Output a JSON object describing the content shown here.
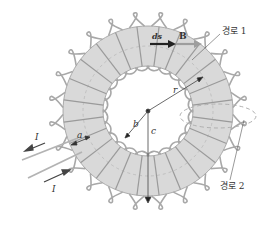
{
  "figure": {
    "type": "toroid",
    "turns": 24,
    "colors": {
      "core_fill": "#d9d9d9",
      "core_stroke": "#9a9a9a",
      "winding": "#a8a8a8",
      "path_dashed": "#b0b0b0",
      "arrow_dark": "#333333",
      "arrow_light": "#9e9e9e",
      "text": "#333333"
    }
  },
  "labels": {
    "path1": "경로 1",
    "path2": "경로 2",
    "ds": "ds",
    "B": "B",
    "r": "r",
    "b": "b",
    "c": "c",
    "a": "a",
    "I_out": "I",
    "I_in": "I"
  }
}
